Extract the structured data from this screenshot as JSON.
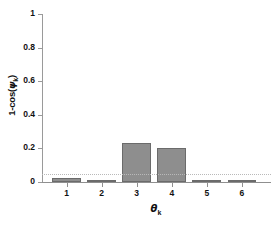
{
  "chart_data": {
    "type": "bar",
    "title": "",
    "xlabel": "θₖ",
    "ylabel": "1-cos(ψₖ)",
    "categories": [
      "1",
      "2",
      "3",
      "4",
      "5",
      "6"
    ],
    "values": [
      0.025,
      0.002,
      0.23,
      0.2,
      0.005,
      0.001
    ],
    "ylim": [
      0,
      1
    ],
    "xlim": [
      0.3,
      6.8
    ],
    "yticks": [
      "0",
      "0.2",
      "0.4",
      "0.6",
      "0.8",
      "1"
    ],
    "ytick_values": [
      0,
      0.2,
      0.4,
      0.6,
      0.8,
      1
    ],
    "xticks": [
      "1",
      "2",
      "3",
      "4",
      "5",
      "6"
    ],
    "grid": false,
    "legend": null,
    "annotations": [
      {
        "type": "hline",
        "label": "threshold",
        "value": 0.05,
        "style": "dotted",
        "color": "#b9b9b9"
      }
    ],
    "bar_color": "#8e8e8e",
    "bar_edge_color": "#6b6b6b",
    "axis_color": "#8f8f8f",
    "background": "#ffffff"
  },
  "axis": {
    "ylabel_main": "1-cos(",
    "ylabel_psi": "ψ",
    "ylabel_sub": "k",
    "ylabel_close": ")",
    "xlabel_theta": "θ",
    "xlabel_sub": "k"
  }
}
